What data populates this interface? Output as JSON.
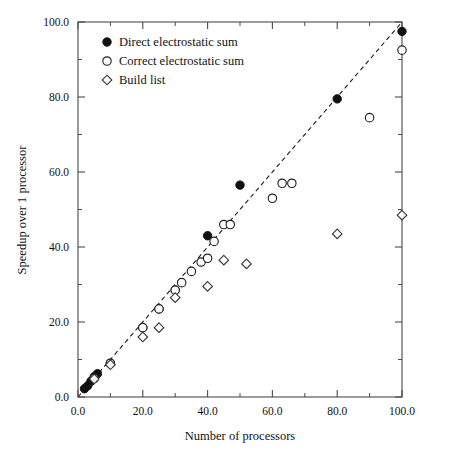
{
  "chart_data": {
    "type": "scatter",
    "title": "",
    "xlabel": "Number of processors",
    "ylabel": "Speedup over 1 processor",
    "xlim": [
      0,
      100
    ],
    "ylim": [
      0,
      100
    ],
    "grid": false,
    "legend_position": "top-left",
    "x_ticks": [
      0,
      20,
      40,
      60,
      80,
      100
    ],
    "x_tick_labels": [
      "0.0",
      "20.0",
      "40.0",
      "60.0",
      "80.0",
      "100.0"
    ],
    "x_minor_ticks": [
      10,
      30,
      50,
      70,
      90
    ],
    "y_ticks": [
      0,
      20,
      40,
      60,
      80,
      100
    ],
    "y_tick_labels": [
      "0.0",
      "20.0",
      "40.0",
      "60.0",
      "80.0",
      "100.0"
    ],
    "y_minor_ticks": [
      10,
      30,
      50,
      70,
      90
    ],
    "annotations": [
      {
        "name": "ideal-speedup-line",
        "type": "line",
        "from": [
          0,
          0
        ],
        "to": [
          100,
          100
        ],
        "style": "dashed"
      }
    ],
    "series": [
      {
        "name": "Direct electrostatic sum",
        "marker": "filled-circle",
        "color": "#111111",
        "points": [
          [
            2,
            2.2
          ],
          [
            3,
            3.0
          ],
          [
            4,
            4.2
          ],
          [
            5,
            5.4
          ],
          [
            6,
            6.2
          ],
          [
            10,
            9.0
          ],
          [
            20,
            18.5
          ],
          [
            25,
            23.5
          ],
          [
            30,
            28.5
          ],
          [
            40,
            43.0
          ],
          [
            50,
            56.5
          ],
          [
            80,
            79.5
          ],
          [
            100,
            97.5
          ]
        ]
      },
      {
        "name": "Correct electrostatic sum",
        "marker": "open-circle",
        "color": "#222222",
        "points": [
          [
            5,
            5.0
          ],
          [
            10,
            9.0
          ],
          [
            20,
            18.5
          ],
          [
            25,
            23.5
          ],
          [
            30,
            28.5
          ],
          [
            32,
            30.5
          ],
          [
            35,
            33.5
          ],
          [
            38,
            36.0
          ],
          [
            40,
            37.0
          ],
          [
            42,
            41.5
          ],
          [
            45,
            46.0
          ],
          [
            47,
            46.0
          ],
          [
            60,
            53.0
          ],
          [
            63,
            57.0
          ],
          [
            66,
            57.0
          ],
          [
            90,
            74.5
          ],
          [
            100,
            92.5
          ]
        ]
      },
      {
        "name": "Build list",
        "marker": "open-diamond",
        "color": "#333333",
        "points": [
          [
            5,
            4.8
          ],
          [
            10,
            8.6
          ],
          [
            20,
            16.0
          ],
          [
            25,
            18.5
          ],
          [
            30,
            26.5
          ],
          [
            40,
            29.5
          ],
          [
            45,
            36.5
          ],
          [
            52,
            35.5
          ],
          [
            80,
            43.5
          ],
          [
            100,
            48.5
          ]
        ]
      }
    ]
  },
  "legend": {
    "entries": [
      {
        "label": "Direct electrostatic sum",
        "marker": "filled-circle"
      },
      {
        "label": "Correct electrostatic sum",
        "marker": "open-circle"
      },
      {
        "label": "Build list",
        "marker": "open-diamond"
      }
    ]
  }
}
